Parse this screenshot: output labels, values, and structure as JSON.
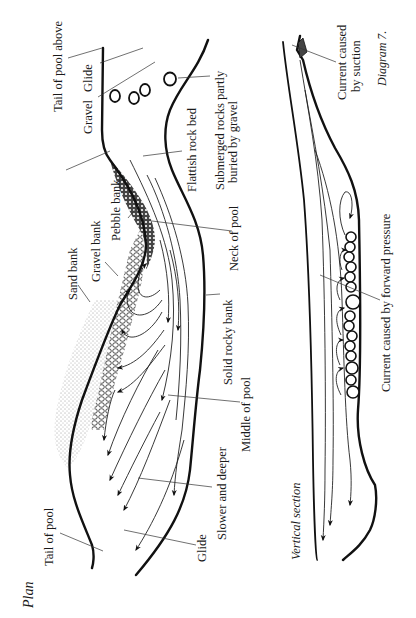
{
  "diagram": {
    "caption": "Diagram 7.",
    "orientation": "rotated 90° counter-clockwise",
    "plan": {
      "title": "Plan",
      "labels": {
        "tail_of_pool_above": "Tail of pool above",
        "glide_top": "Glide",
        "gravel": "Gravel",
        "flattish_rock_bed": "Flattish rock bed",
        "submerged_rocks_line1": "Submerged rocks partly",
        "submerged_rocks_line2": "buried by gravel",
        "pebble_bank": "Pebble bank",
        "gravel_bank": "Gravel bank",
        "sand_bank": "Sand bank",
        "neck_of_pool": "Neck of pool",
        "solid_rocky_bank": "Solid rocky bank",
        "middle_of_pool": "Middle of pool",
        "slower_and_deeper": "Slower and deeper",
        "glide_bottom": "Glide",
        "tail_of_pool": "Tail of pool"
      }
    },
    "vertical_section": {
      "title": "Vertical section",
      "labels": {
        "current_suction_line1": "Current caused",
        "current_suction_line2": "by suction",
        "current_forward_pressure": "Current caused by forward pressure"
      }
    }
  }
}
